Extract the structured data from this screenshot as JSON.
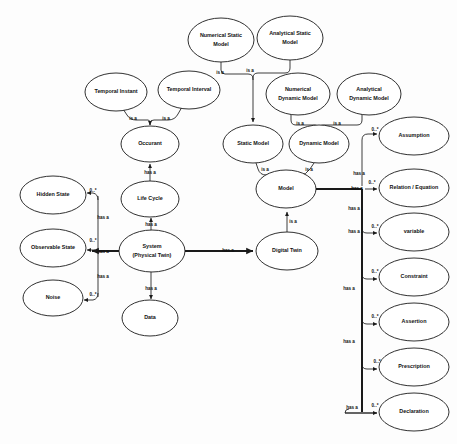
{
  "diagram": {
    "type": "concept-map",
    "width": 457,
    "height": 444,
    "background_color": "#ffffff",
    "node_fill": "#ffffff",
    "node_stroke": "#1a1a1a",
    "nodes": [
      {
        "id": "numerical-static-model",
        "label": "Numerical Static\nModel",
        "lines": [
          "Numerical Static",
          "Model"
        ],
        "cx": 221,
        "cy": 40,
        "rx": 33,
        "ry": 22
      },
      {
        "id": "analytical-static-model",
        "label": "Analytical Static\nModel",
        "lines": [
          "Analytical Static",
          "Model"
        ],
        "cx": 290,
        "cy": 38,
        "rx": 33,
        "ry": 22
      },
      {
        "id": "temporal-instant",
        "label": "Temporal Instant",
        "lines": [
          "Temporal Instant"
        ],
        "cx": 116,
        "cy": 92,
        "rx": 31,
        "ry": 19
      },
      {
        "id": "temporal-interval",
        "label": "Temporal Interval",
        "lines": [
          "Temporal Interval"
        ],
        "cx": 189,
        "cy": 90,
        "rx": 31,
        "ry": 19
      },
      {
        "id": "numerical-dynamic-model",
        "label": "Numerical Dynamic Model",
        "lines": [
          "Numerical",
          "Dynamic Model"
        ],
        "cx": 298,
        "cy": 94,
        "rx": 32,
        "ry": 21
      },
      {
        "id": "analytical-dynamic-model",
        "label": "Analytical Dynamic Model",
        "lines": [
          "Analytical",
          "Dynamic Model"
        ],
        "cx": 369,
        "cy": 94,
        "rx": 32,
        "ry": 21
      },
      {
        "id": "occurrent",
        "label": "Occurant",
        "lines": [
          "Occurant"
        ],
        "cx": 150,
        "cy": 144,
        "rx": 29,
        "ry": 18
      },
      {
        "id": "static-model",
        "label": "Static Model",
        "lines": [
          "Static Model"
        ],
        "cx": 253,
        "cy": 144,
        "rx": 30,
        "ry": 19
      },
      {
        "id": "dynamic-model",
        "label": "Dynamic Model",
        "lines": [
          "Dynamic Model"
        ],
        "cx": 319,
        "cy": 144,
        "rx": 30,
        "ry": 19
      },
      {
        "id": "assumption",
        "label": "Assumption",
        "cx": 414,
        "cy": 136,
        "rx": 35,
        "ry": 19,
        "lines": [
          "Assumption"
        ]
      },
      {
        "id": "model",
        "label": "Model",
        "lines": [
          "Model"
        ],
        "cx": 286,
        "cy": 189,
        "rx": 30,
        "ry": 19
      },
      {
        "id": "relation-equation",
        "label": "Relation / Equation",
        "lines": [
          "Relation / Equation"
        ],
        "cx": 414,
        "cy": 188,
        "rx": 35,
        "ry": 19
      },
      {
        "id": "hidden-state",
        "label": "Hidden State",
        "lines": [
          "Hidden State"
        ],
        "cx": 53,
        "cy": 195,
        "rx": 33,
        "ry": 19
      },
      {
        "id": "life-cycle",
        "label": "Life Cycle",
        "lines": [
          "Life Cycle"
        ],
        "cx": 150,
        "cy": 199,
        "rx": 29,
        "ry": 18
      },
      {
        "id": "variable",
        "label": "variable",
        "lines": [
          "variable"
        ],
        "cx": 414,
        "cy": 232,
        "rx": 35,
        "ry": 19
      },
      {
        "id": "observable-state",
        "label": "Observable State",
        "lines": [
          "Observable State"
        ],
        "cx": 53,
        "cy": 248,
        "rx": 33,
        "ry": 19
      },
      {
        "id": "system-physical-twin",
        "label": "System (Physical Twin)",
        "lines": [
          "System",
          "(Physical Twin)"
        ],
        "cx": 152,
        "cy": 251,
        "rx": 33,
        "ry": 21
      },
      {
        "id": "digital-twin",
        "label": "Digital Twin",
        "lines": [
          "Digital Twin"
        ],
        "cx": 287,
        "cy": 251,
        "rx": 31,
        "ry": 19
      },
      {
        "id": "constraint",
        "label": "Constraint",
        "lines": [
          "Constraint"
        ],
        "cx": 414,
        "cy": 277,
        "rx": 35,
        "ry": 19
      },
      {
        "id": "noise",
        "label": "Noise",
        "lines": [
          "Noise"
        ],
        "cx": 53,
        "cy": 298,
        "rx": 30,
        "ry": 18
      },
      {
        "id": "assertion",
        "label": "Assertion",
        "lines": [
          "Assertion"
        ],
        "cx": 414,
        "cy": 322,
        "rx": 35,
        "ry": 19
      },
      {
        "id": "data",
        "label": "Data",
        "lines": [
          "Data"
        ],
        "cx": 150,
        "cy": 318,
        "rx": 28,
        "ry": 18
      },
      {
        "id": "prescription",
        "label": "Prescription",
        "lines": [
          "Prescription"
        ],
        "cx": 414,
        "cy": 367,
        "rx": 35,
        "ry": 19
      },
      {
        "id": "declaration",
        "label": "Declaration",
        "lines": [
          "Declaration"
        ],
        "cx": 414,
        "cy": 412,
        "rx": 35,
        "ry": 19
      }
    ],
    "edges": [
      {
        "from": "numerical-static-model",
        "to": "static-model",
        "label": "is a",
        "label_x": 220,
        "label_y": 71
      },
      {
        "from": "analytical-static-model",
        "to": "static-model",
        "label": "is a",
        "label_x": 249,
        "label_y": 70
      },
      {
        "from": "temporal-instant",
        "to": "occurrent",
        "label": "is a",
        "label_x": 133,
        "label_y": 119
      },
      {
        "from": "temporal-interval",
        "to": "occurrent",
        "label": "is a",
        "label_x": 166,
        "label_y": 119
      },
      {
        "from": "numerical-dynamic-model",
        "to": "dynamic-model",
        "label": "is a",
        "label_x": 300,
        "label_y": 124
      },
      {
        "from": "analytical-dynamic-model",
        "to": "dynamic-model",
        "label": "is a",
        "label_x": 336,
        "label_y": 124
      },
      {
        "from": "static-model",
        "to": "model",
        "label": "is a",
        "label_x": 264,
        "label_y": 168
      },
      {
        "from": "dynamic-model",
        "to": "model",
        "label": "is a",
        "label_x": 310,
        "label_y": 168
      },
      {
        "from": "occurrent",
        "to": "life-cycle",
        "label": "has a",
        "label_x": 150,
        "label_y": 172,
        "reversed": true
      },
      {
        "from": "life-cycle",
        "to": "system-physical-twin",
        "label": "has a",
        "label_x": 150,
        "label_y": 223,
        "reversed": true
      },
      {
        "from": "system-physical-twin",
        "to": "digital-twin",
        "label": "has a",
        "label_x": 227,
        "label_y": 251
      },
      {
        "from": "system-physical-twin",
        "to": "data",
        "label": "has a",
        "label_x": 150,
        "label_y": 290
      },
      {
        "from": "system-physical-twin",
        "to": "hidden-state",
        "label": "has a",
        "label_x": 101,
        "label_y": 219,
        "multiplicity": "0..*",
        "mult_x": 92,
        "mult_y": 192
      },
      {
        "from": "system-physical-twin",
        "to": "observable-state",
        "label": "has a",
        "label_x": 101,
        "label_y": 251,
        "multiplicity": "0..*",
        "mult_x": 92,
        "mult_y": 241
      },
      {
        "from": "system-physical-twin",
        "to": "noise",
        "label": "has a",
        "label_x": 101,
        "label_y": 278,
        "multiplicity": "0..*",
        "mult_x": 92,
        "mult_y": 295
      },
      {
        "from": "digital-twin",
        "to": "model",
        "label": "is a",
        "label_x": 292,
        "label_y": 221
      },
      {
        "from": "model",
        "to": "assumption",
        "label": "has a",
        "label_x": 361,
        "label_y": 174,
        "multiplicity": "0..*",
        "mult_x": 378,
        "mult_y": 131
      },
      {
        "from": "model",
        "to": "relation-equation",
        "label": "has a",
        "label_x": 358,
        "label_y": 189,
        "multiplicity": "0..*",
        "mult_x": 378,
        "mult_y": 183
      },
      {
        "from": "model",
        "to": "variable",
        "label": "has a",
        "label_x": 354,
        "label_y": 208,
        "multiplicity": "0..*",
        "mult_x": 378,
        "mult_y": 226
      },
      {
        "from": "model",
        "to": "constraint",
        "label": "has a",
        "label_x": 354,
        "label_y": 232,
        "multiplicity": "0..*",
        "mult_x": 378,
        "mult_y": 271
      },
      {
        "from": "model",
        "to": "assertion",
        "label": "has a",
        "label_x": 349,
        "label_y": 288,
        "multiplicity": "0..*",
        "mult_x": 378,
        "mult_y": 316
      },
      {
        "from": "model",
        "to": "prescription",
        "label": "has a",
        "label_x": 349,
        "label_y": 341,
        "multiplicity": "0..*",
        "mult_x": 380,
        "mult_y": 361
      },
      {
        "from": "model",
        "to": "declaration",
        "label": "has a",
        "label_x": 352,
        "label_y": 407,
        "multiplicity": "0..*",
        "mult_x": 378,
        "mult_y": 406
      }
    ],
    "edge_labels": {
      "is_a": "is a",
      "has_a": "has a",
      "multiplicity_zero_to_many": "0..*"
    }
  }
}
